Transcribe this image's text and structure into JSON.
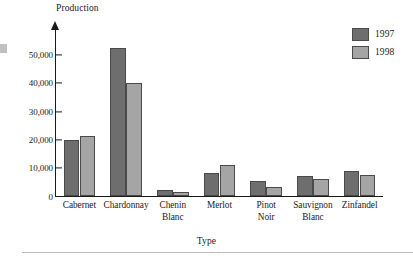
{
  "chart_data": {
    "type": "bar",
    "title": "",
    "xlabel": "Type",
    "ylabel": "Production",
    "categories": [
      "Cabernet",
      "Chardonnay",
      "Chenin\nBlanc",
      "Merlot",
      "Pinot\nNoir",
      "Sauvignon\nBlanc",
      "Zinfandel"
    ],
    "series": [
      {
        "name": "1997",
        "color": "#6e6e6e",
        "values": [
          19800,
          52500,
          2400,
          8200,
          5500,
          7200,
          9000
        ]
      },
      {
        "name": "1998",
        "color": "#a5a5a5",
        "values": [
          21300,
          40000,
          1500,
          11200,
          3200,
          6200,
          7700
        ]
      }
    ],
    "ylim": [
      0,
      55000
    ],
    "yticks": [
      0,
      10000,
      20000,
      30000,
      40000,
      50000
    ],
    "ytick_labels": [
      "0",
      "10,000",
      "20,000",
      "30,000",
      "40,000",
      "50,000"
    ],
    "grid": false,
    "legend_position": "top-right"
  },
  "legend": {
    "entries": [
      {
        "label": "1997",
        "color": "#6e6e6e"
      },
      {
        "label": "1998",
        "color": "#a5a5a5"
      }
    ]
  },
  "axes": {
    "y_axis_title": "Production",
    "x_axis_title": "Type"
  }
}
